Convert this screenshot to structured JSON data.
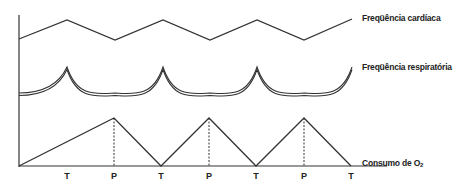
{
  "diagram": {
    "series": [
      {
        "id": "heart_rate",
        "label": "Freqüência cardíaca",
        "shape": "zigzag",
        "points": [
          [
            19,
            39
          ],
          [
            67,
            20
          ],
          [
            115,
            40
          ],
          [
            163,
            20
          ],
          [
            210,
            40
          ],
          [
            257,
            20
          ],
          [
            304,
            40
          ],
          [
            352,
            19
          ]
        ]
      },
      {
        "id": "respiratory_rate",
        "label": "Freqüência respiratória",
        "shape": "scalloped-double-line",
        "peaks_x": [
          67,
          163,
          257,
          352
        ],
        "peak_y": 67,
        "trough_y": 93
      },
      {
        "id": "o2_consumption",
        "label_main": "Consumo de O",
        "label_sub": "2",
        "shape": "triangle-wave",
        "points": [
          [
            19,
            166
          ],
          [
            114,
            118
          ],
          [
            161,
            166
          ],
          [
            209,
            118
          ],
          [
            256,
            166
          ],
          [
            304,
            118
          ],
          [
            351,
            166
          ]
        ]
      }
    ],
    "x_ticks": [
      {
        "label": "T",
        "x": 67
      },
      {
        "label": "P",
        "x": 114
      },
      {
        "label": "T",
        "x": 161
      },
      {
        "label": "P",
        "x": 209
      },
      {
        "label": "T",
        "x": 256
      },
      {
        "label": "P",
        "x": 304
      },
      {
        "label": "T",
        "x": 351
      }
    ],
    "dashed_lines_x": [
      114,
      209,
      304
    ],
    "colors": {
      "line": "#333333",
      "text": "#222222",
      "background": "#ffffff"
    }
  }
}
